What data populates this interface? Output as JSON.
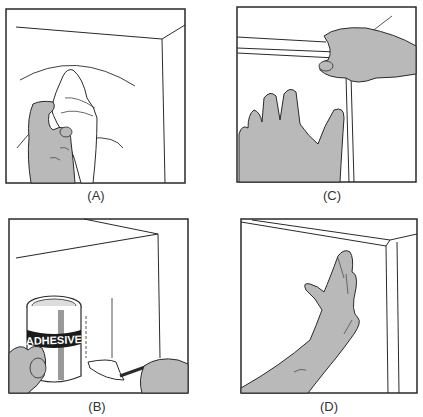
{
  "figure": {
    "panels": [
      {
        "id": "A",
        "label": "(A)",
        "description": "Hand wiping wall corner with cloth"
      },
      {
        "id": "B",
        "label": "(B)",
        "description": "Applying adhesive with brush from can",
        "can_label": "ADHESIVE"
      },
      {
        "id": "C",
        "label": "(C)",
        "description": "Positioning trim strip along wall"
      },
      {
        "id": "D",
        "label": "(D)",
        "description": "Pressing strip flat with palm"
      }
    ]
  },
  "colors": {
    "skin_fill": "#b9b9b9",
    "line": "#2a2a2a",
    "background": "#ffffff"
  }
}
